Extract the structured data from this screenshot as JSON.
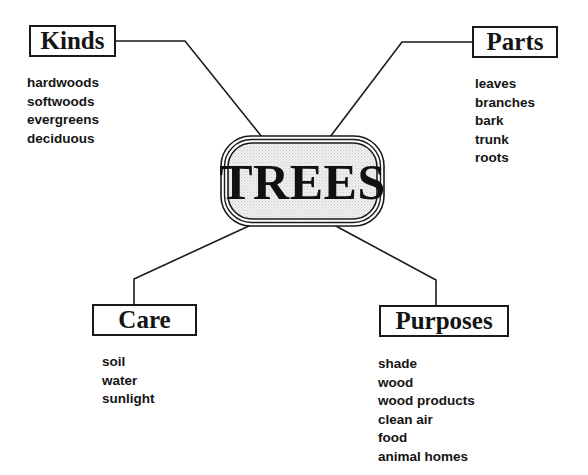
{
  "diagram": {
    "type": "concept-map",
    "center": {
      "label": "TREES"
    },
    "branches": [
      {
        "id": "kinds",
        "label": "Kinds",
        "items": [
          "hardwoods",
          "softwoods",
          "evergreens",
          "deciduous"
        ]
      },
      {
        "id": "parts",
        "label": "Parts",
        "items": [
          "leaves",
          "branches",
          "bark",
          "trunk",
          "roots"
        ]
      },
      {
        "id": "care",
        "label": "Care",
        "items": [
          "soil",
          "water",
          "sunlight"
        ]
      },
      {
        "id": "purposes",
        "label": "Purposes",
        "items": [
          "shade",
          "wood",
          "wood products",
          "clean air",
          "food",
          "animal homes"
        ]
      }
    ]
  },
  "colors": {
    "line": "#1a1a1a",
    "text": "#141414",
    "center_fill": "#e6e6e6",
    "background": "#ffffff"
  }
}
